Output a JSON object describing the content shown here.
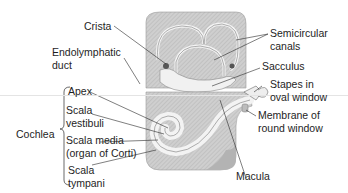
{
  "diagram": {
    "labels": {
      "crista": "Crista",
      "endolymphatic_duct_1": "Endolymphatic",
      "endolymphatic_duct_2": "duct",
      "semicircular_1": "Semicircular",
      "semicircular_2": "canals",
      "sacculus": "Sacculus",
      "stapes_1": "Stapes in",
      "stapes_2": "oval window",
      "membrane_1": "Membrane of",
      "membrane_2": "round window",
      "macula": "Macula",
      "cochlea": "Cochlea",
      "apex": "Apex",
      "scala_vestibuli_1": "Scala",
      "scala_vestibuli_2": "vestibuli",
      "scala_media_1": "Scala media",
      "scala_media_2": "(organ of Corti)",
      "scala_tympani_1": "Scala",
      "scala_tympani_2": "tympani"
    },
    "colors": {
      "bone": "#c9c9c9",
      "bone_dark": "#a8a8a8",
      "membrane": "#f2f2f2",
      "line": "#2a2a2a"
    }
  }
}
